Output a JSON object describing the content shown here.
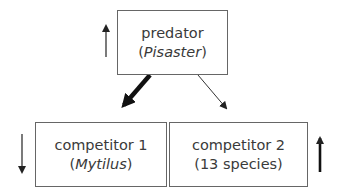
{
  "diagram": {
    "nodes": [
      {
        "id": "predator",
        "label": "predator",
        "sub_prefix": "(",
        "sub_italic": "Pisaster",
        "sub_suffix": ")",
        "trend": "up",
        "trend_weight": "thin"
      },
      {
        "id": "competitor1",
        "label": "competitor 1",
        "sub_prefix": "(",
        "sub_italic": "Mytilus",
        "sub_suffix": ")",
        "trend": "down",
        "trend_weight": "thin"
      },
      {
        "id": "competitor2",
        "label": "competitor 2",
        "sub_prefix": "",
        "sub_plain": "(13 species)",
        "sub_suffix": "",
        "trend": "up",
        "trend_weight": "thick"
      }
    ],
    "edges": [
      {
        "from": "predator",
        "to": "competitor1",
        "weight": "thick"
      },
      {
        "from": "predator",
        "to": "competitor2",
        "weight": "thin"
      }
    ]
  }
}
